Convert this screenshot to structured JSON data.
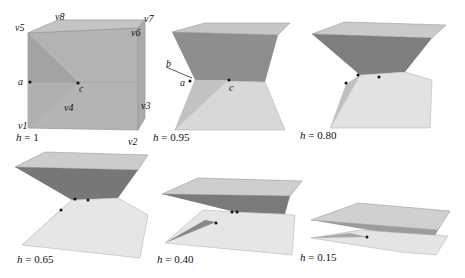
{
  "figure": {
    "panels": [
      {
        "id": "p1",
        "h_label": "h",
        "h_value": "= 1"
      },
      {
        "id": "p2",
        "h_label": "h",
        "h_value": "= 0.95"
      },
      {
        "id": "p3",
        "h_label": "h",
        "h_value": "= 0.80"
      },
      {
        "id": "p4",
        "h_label": "h",
        "h_value": "= 0.65"
      },
      {
        "id": "p5",
        "h_label": "h",
        "h_value": "= 0.40"
      },
      {
        "id": "p6",
        "h_label": "h",
        "h_value": "= 0.15"
      }
    ],
    "vertex_labels": {
      "v1": "v1",
      "v2": "v2",
      "v3": "v3",
      "v4": "v4",
      "v5": "v5",
      "v6": "v6",
      "v7": "v7",
      "v8": "v8"
    },
    "point_labels": {
      "a": "a",
      "b": "b",
      "c": "c"
    },
    "colors": {
      "face_light": "#c8c8c8",
      "face_mid": "#a8a8a8",
      "face_dark": "#7a7a7a",
      "face_pale": "#e4e4e4",
      "edge": "#8a8a8a",
      "dot": "#111111"
    }
  }
}
